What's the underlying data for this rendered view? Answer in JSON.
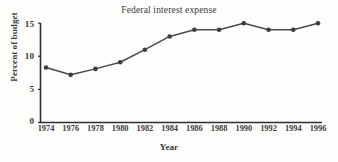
{
  "chart_data": {
    "type": "line",
    "title": "Federal interest expense",
    "xlabel": "Year",
    "ylabel": "Percent of budget",
    "x": [
      1974,
      1976,
      1978,
      1980,
      1982,
      1984,
      1986,
      1988,
      1990,
      1992,
      1994,
      1996
    ],
    "categories": [
      "1974",
      "1976",
      "1978",
      "1980",
      "1982",
      "1984",
      "1986",
      "1988",
      "1990",
      "1992",
      "1994",
      "1996"
    ],
    "values": [
      8.3,
      7.2,
      8.1,
      9.1,
      11.0,
      13.0,
      14.0,
      14.0,
      15.0,
      14.0,
      14.0,
      15.0
    ],
    "series": [
      {
        "name": "Federal interest expense",
        "values": [
          8.3,
          7.2,
          8.1,
          9.1,
          11.0,
          13.0,
          14.0,
          14.0,
          15.0,
          14.0,
          14.0,
          15.0
        ]
      }
    ],
    "ylim": [
      0,
      15
    ],
    "xlim": [
      1973,
      1997
    ],
    "yticks": [
      0,
      5,
      10,
      15
    ],
    "ytick_labels": [
      "0",
      "5",
      "10",
      "15"
    ],
    "xtick_labels": [
      "1974",
      "1976",
      "1978",
      "1980",
      "1982",
      "1984",
      "1986",
      "1988",
      "1990",
      "1992",
      "1994",
      "1996"
    ],
    "grid": false,
    "legend": "none",
    "marker": "filled-circle",
    "line_color": "#4a4a4a",
    "marker_color": "#3d3d3d",
    "axis_color": "#2f2f2f",
    "background_color": "#fdfdfc"
  }
}
